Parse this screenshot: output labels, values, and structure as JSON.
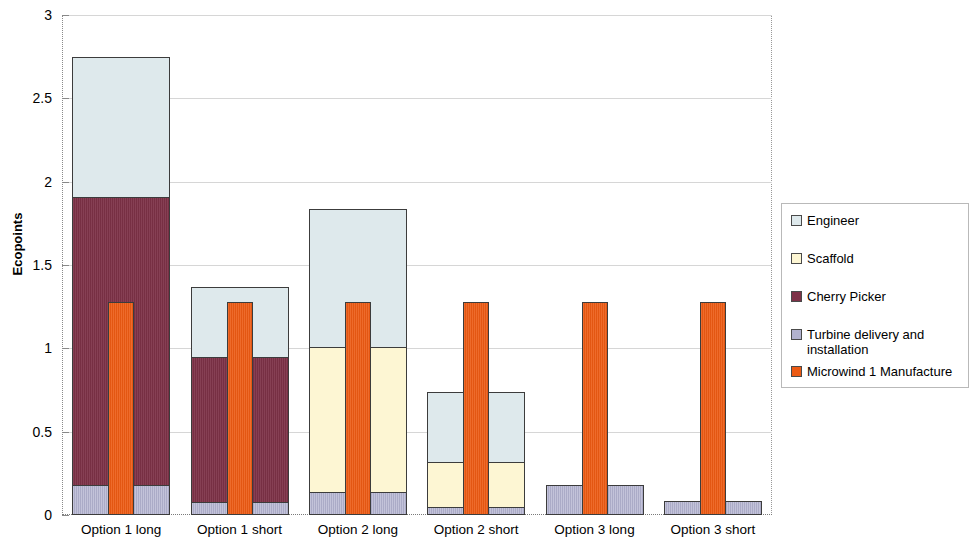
{
  "chart_data": {
    "type": "bar",
    "title": "",
    "subtitle": "",
    "xlabel": "",
    "ylabel": "Ecopoints",
    "ylim": [
      0,
      3
    ],
    "ytick_labels": [
      "0",
      "0.5",
      "1",
      "1.5",
      "2",
      "2.5",
      "3"
    ],
    "ytick_values": [
      0,
      0.5,
      1,
      1.5,
      2,
      2.5,
      3
    ],
    "grid": true,
    "stacked": true,
    "legend_position": "right",
    "categories": [
      "Option 1 long",
      "Option 1 short",
      "Option 2 long",
      "Option 2 short",
      "Option 3 long",
      "Option 3 short"
    ],
    "series": [
      {
        "name": "Engineer",
        "color": "#dee9ec",
        "values": [
          0.84,
          0.42,
          0.83,
          0.42,
          0.0,
          0.0
        ]
      },
      {
        "name": "Scaffold",
        "color": "#fdf6d3",
        "values": [
          0.0,
          0.0,
          0.87,
          0.27,
          0.0,
          0.0
        ]
      },
      {
        "name": "Cherry Picker",
        "color": "#7d3147",
        "values": [
          1.73,
          0.87,
          0.0,
          0.0,
          0.0,
          0.0
        ]
      },
      {
        "name": "Turbine delivery and installation",
        "color": "#b2b2cf",
        "values": [
          0.175,
          0.075,
          0.13,
          0.04,
          0.175,
          0.08
        ]
      }
    ],
    "overlay_series": {
      "name": "Microwind 1 Manufacture",
      "color": "#ec5a13",
      "values": [
        1.28,
        1.28,
        1.28,
        1.28,
        1.28,
        1.28
      ]
    },
    "stack_totals": [
      2.745,
      1.365,
      1.83,
      0.73,
      0.175,
      0.08
    ],
    "annotations": []
  },
  "legend": {
    "items": [
      {
        "label": "Engineer",
        "swatch": "engineer"
      },
      {
        "label": "Scaffold",
        "swatch": "scaffold"
      },
      {
        "label": "Cherry Picker",
        "swatch": "cherry"
      },
      {
        "label": "Turbine delivery and installation",
        "swatch": "turbine"
      },
      {
        "label": "Microwind 1 Manufacture",
        "swatch": "microwind"
      }
    ]
  }
}
